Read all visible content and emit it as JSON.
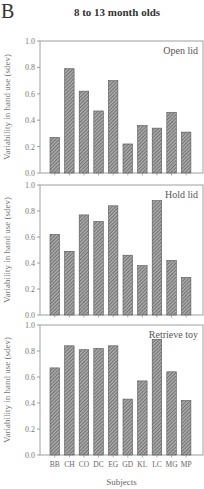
{
  "figure": {
    "panel_letter": "B",
    "title": "8 to 13 month olds"
  },
  "chart_data": [
    {
      "type": "bar",
      "title": "Open lid",
      "xlabel": "",
      "ylabel": "Variability in hand use (sdev)",
      "ylim": [
        0,
        1.0
      ],
      "yticks": [
        "0.0",
        "0.2",
        "0.4",
        "0.6",
        "0.8",
        "1.0"
      ],
      "categories": [
        "BB",
        "CH",
        "CO",
        "DC",
        "EG",
        "GD",
        "KL",
        "LC",
        "MG",
        "MP"
      ],
      "values": [
        0.27,
        0.79,
        0.62,
        0.47,
        0.7,
        0.22,
        0.36,
        0.34,
        0.46,
        0.31
      ],
      "grid": false
    },
    {
      "type": "bar",
      "title": "Hold lid",
      "xlabel": "",
      "ylabel": "Variability in hand use (sdev)",
      "ylim": [
        0,
        1.0
      ],
      "yticks": [
        "0.0",
        "0.2",
        "0.4",
        "0.6",
        "0.8",
        "1.0"
      ],
      "categories": [
        "BB",
        "CH",
        "CO",
        "DC",
        "EG",
        "GD",
        "KL",
        "LC",
        "MG",
        "MP"
      ],
      "values": [
        0.62,
        0.49,
        0.77,
        0.72,
        0.84,
        0.46,
        0.38,
        0.88,
        0.42,
        0.29
      ],
      "grid": false
    },
    {
      "type": "bar",
      "title": "Retrieve toy",
      "xlabel": "Subjects",
      "ylabel": "Variability in hand use (sdev)",
      "ylim": [
        0,
        1.0
      ],
      "yticks": [
        "0.0",
        "0.2",
        "0.4",
        "0.6",
        "0.8",
        "1.0"
      ],
      "categories": [
        "BB",
        "CH",
        "CO",
        "DC",
        "EG",
        "GD",
        "KL",
        "LC",
        "MG",
        "MP"
      ],
      "values": [
        0.67,
        0.84,
        0.81,
        0.82,
        0.84,
        0.43,
        0.57,
        0.89,
        0.64,
        0.42
      ],
      "grid": false
    }
  ],
  "colors": {
    "bar_fill": "#9a9a9a",
    "bar_hatch": "#555555",
    "axis": "#888888"
  }
}
